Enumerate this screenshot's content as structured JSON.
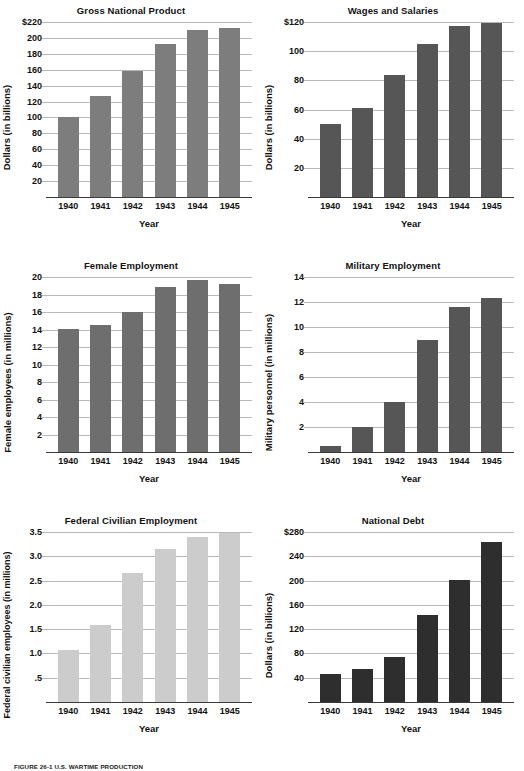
{
  "figure": {
    "caption": "FIGURE 26-1  U.S. WARTIME PRODUCTION",
    "x_axis_title": "Year",
    "years": [
      "1940",
      "1941",
      "1942",
      "1943",
      "1944",
      "1945"
    ]
  },
  "colors": {
    "bar_medium_gray": "#7d7d7d",
    "bar_dark_gray": "#565656",
    "bar_light_gray": "#cccccc",
    "bar_near_black": "#3a3a3a",
    "gridline": "#b9b9b9",
    "axis": "#3a3a3a",
    "text": "#111111",
    "background": "#ffffff"
  },
  "chart_data": [
    {
      "type": "bar",
      "id": "gross-national-product",
      "title": "Gross National Product",
      "xlabel": "Year",
      "ylabel": "Dollars (in billions)",
      "categories": [
        "1940",
        "1941",
        "1942",
        "1943",
        "1944",
        "1945"
      ],
      "values": [
        100,
        127,
        158,
        192,
        210,
        213
      ],
      "ylim": [
        0,
        220
      ],
      "yticks": [
        20,
        40,
        60,
        80,
        100,
        120,
        140,
        160,
        180,
        200,
        220
      ],
      "ytick_labels": [
        "20",
        "40",
        "60",
        "80",
        "100",
        "120",
        "140",
        "160",
        "180",
        "200",
        "$220"
      ],
      "grid": true,
      "bar_color": "#7d7d7d"
    },
    {
      "type": "bar",
      "id": "wages-and-salaries",
      "title": "Wages and Salaries",
      "xlabel": "Year",
      "ylabel": "Dollars (in billions)",
      "categories": [
        "1940",
        "1941",
        "1942",
        "1943",
        "1944",
        "1945"
      ],
      "values": [
        50,
        61,
        84,
        105,
        117,
        119
      ],
      "ylim": [
        0,
        120
      ],
      "yticks": [
        20,
        40,
        60,
        80,
        100,
        120
      ],
      "ytick_labels": [
        "20",
        "40",
        "60",
        "80",
        "100",
        "$120"
      ],
      "grid": true,
      "bar_color": "#565656"
    },
    {
      "type": "bar",
      "id": "female-employment",
      "title": "Female Employment",
      "xlabel": "Year",
      "ylabel": "Female employees (in millions)",
      "categories": [
        "1940",
        "1941",
        "1942",
        "1943",
        "1944",
        "1945"
      ],
      "values": [
        14.1,
        14.5,
        16.0,
        18.9,
        19.7,
        19.2
      ],
      "ylim": [
        0,
        20
      ],
      "yticks": [
        2,
        4,
        6,
        8,
        10,
        12,
        14,
        16,
        18,
        20
      ],
      "ytick_labels": [
        "2",
        "4",
        "6",
        "8",
        "10",
        "12",
        "14",
        "16",
        "18",
        "20"
      ],
      "grid": true,
      "bar_color": "#6e6e6e"
    },
    {
      "type": "bar",
      "id": "military-employment",
      "title": "Military Employment",
      "xlabel": "Year",
      "ylabel": "Military personnel (in millions)",
      "categories": [
        "1940",
        "1941",
        "1942",
        "1943",
        "1944",
        "1945"
      ],
      "values": [
        0.5,
        2.0,
        4.0,
        9.0,
        11.6,
        12.3
      ],
      "ylim": [
        0,
        14
      ],
      "yticks": [
        2,
        4,
        6,
        8,
        10,
        12,
        14
      ],
      "ytick_labels": [
        "2",
        "4",
        "6",
        "8",
        "10",
        "12",
        "14"
      ],
      "grid": true,
      "bar_color": "#565656"
    },
    {
      "type": "bar",
      "id": "federal-civilian-employment",
      "title": "Federal Civilian Employment",
      "xlabel": "Year",
      "ylabel": "Federal civilian employees (in millions)",
      "categories": [
        "1940",
        "1941",
        "1942",
        "1943",
        "1944",
        "1945"
      ],
      "values": [
        1.08,
        1.58,
        2.65,
        3.15,
        3.4,
        3.47
      ],
      "ylim": [
        0,
        3.5
      ],
      "yticks": [
        0.5,
        1.0,
        1.5,
        2.0,
        2.5,
        3.0,
        3.5
      ],
      "ytick_labels": [
        ".5",
        "1.0",
        "1.5",
        "2.0",
        "2.5",
        "3.0",
        "3.5"
      ],
      "grid": true,
      "bar_color": "#cccccc"
    },
    {
      "type": "bar",
      "id": "national-debt",
      "title": "National Debt",
      "xlabel": "Year",
      "ylabel": "Dollars (in billions)",
      "categories": [
        "1940",
        "1941",
        "1942",
        "1943",
        "1944",
        "1945"
      ],
      "values": [
        46,
        55,
        74,
        143,
        201,
        263
      ],
      "ylim": [
        0,
        280
      ],
      "yticks": [
        40,
        80,
        120,
        160,
        200,
        240,
        280
      ],
      "ytick_labels": [
        "40",
        "80",
        "120",
        "160",
        "200",
        "240",
        "$280"
      ],
      "grid": true,
      "bar_color": "#2e2e2e"
    }
  ]
}
